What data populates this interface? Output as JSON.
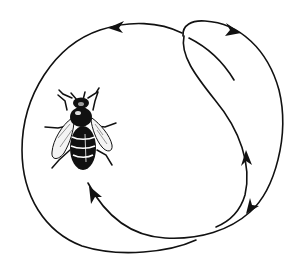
{
  "figure": {
    "title": "Honeybee round dance",
    "stroke_color": "#111111",
    "background_color": "#ffffff",
    "paths": [
      {
        "name": "outer-loop-path",
        "direction": "counterclockwise-left, clockwise-right"
      },
      {
        "name": "inner-return-path",
        "direction": "upward"
      },
      {
        "name": "inner-short-stroke",
        "direction": "none"
      }
    ],
    "arrows": [
      {
        "name": "arrow-top-left",
        "points": "left"
      },
      {
        "name": "arrow-top-right",
        "points": "right"
      },
      {
        "name": "arrow-right-lower",
        "points": "down-left"
      },
      {
        "name": "arrow-right-inner",
        "points": "up"
      },
      {
        "name": "arrow-bottom-left",
        "points": "up-left"
      }
    ]
  }
}
